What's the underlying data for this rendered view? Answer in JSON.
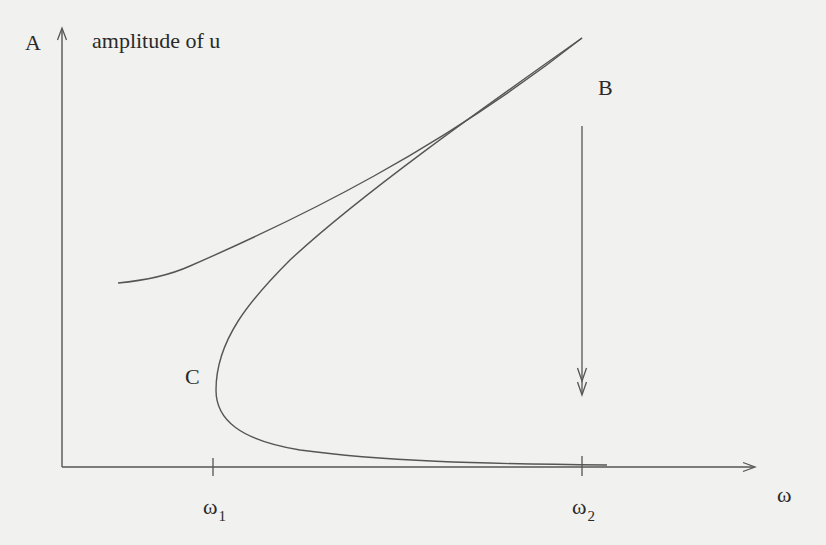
{
  "diagram": {
    "y_axis": {
      "symbol": "A",
      "label": "amplitude of u"
    },
    "x_axis": {
      "symbol": "ω"
    },
    "ticks": [
      {
        "name": "omega-1",
        "base": "ω",
        "sub": "1"
      },
      {
        "name": "omega-2",
        "base": "ω",
        "sub": "2"
      }
    ],
    "points": {
      "B": {
        "label": "B",
        "description": "upper fold point at ω2"
      },
      "C": {
        "label": "C",
        "description": "lower fold point at ω1"
      }
    },
    "branches": [
      {
        "name": "upper-stable-branch",
        "from": "left edge",
        "to": "B"
      },
      {
        "name": "middle-unstable-branch",
        "from": "B",
        "to": "C"
      },
      {
        "name": "lower-stable-branch",
        "from": "C",
        "to": "right end past ω2"
      }
    ],
    "jump_arrow": {
      "name": "jump-down-arrow",
      "at": "ω2",
      "direction": "down",
      "from": "B",
      "to": "lower branch"
    },
    "colors": {
      "background": "#f1f1ef",
      "ink": "#2a2a2a",
      "line": "#555555"
    }
  }
}
